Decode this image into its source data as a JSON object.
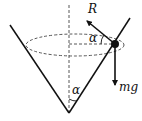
{
  "diagram": {
    "colors": {
      "line": "#111111",
      "background": "#ffffff"
    },
    "labels": {
      "reaction_force": "R",
      "weight": "mg",
      "angle_at_ball": "α",
      "angle_at_apex": "α"
    },
    "elements": [
      {
        "id": "cone-left-side",
        "type": "line",
        "from": [
          10,
          25
        ],
        "to": [
          69,
          113
        ]
      },
      {
        "id": "cone-right-side",
        "type": "line",
        "from": [
          130,
          18
        ],
        "to": [
          69,
          113
        ]
      },
      {
        "id": "axis",
        "type": "dashed-line",
        "from": [
          69,
          5
        ],
        "to": [
          69,
          113
        ]
      },
      {
        "id": "circle-path",
        "type": "dashed-ellipse",
        "center": [
          75,
          45
        ],
        "rx": 49,
        "ry": 11
      },
      {
        "id": "radius",
        "type": "dashed-line",
        "from": [
          69,
          44
        ],
        "to": [
          115,
          44
        ]
      },
      {
        "id": "ball",
        "type": "dot",
        "center": [
          115,
          44
        ],
        "r": 4
      },
      {
        "id": "reaction-arrow",
        "type": "arrow",
        "from": [
          115,
          44
        ],
        "to": [
          86,
          20
        ],
        "label": "R"
      },
      {
        "id": "weight-arrow",
        "type": "arrow",
        "from": [
          115,
          44
        ],
        "to": [
          115,
          86
        ],
        "label": "mg"
      }
    ]
  }
}
